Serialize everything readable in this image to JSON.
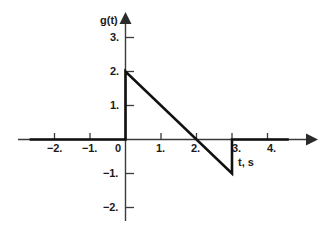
{
  "chart_data": {
    "type": "line",
    "title": "",
    "xlabel": "t, s",
    "ylabel": "g(t)",
    "xlim": [
      -2.7,
      4.7
    ],
    "ylim": [
      -2.5,
      3.4
    ],
    "grid": false,
    "legend": null,
    "xticks": [
      -2,
      -1,
      0,
      1,
      2,
      3,
      4
    ],
    "xtick_labels": [
      "−2.",
      "−1.",
      "0",
      "1.",
      "2.",
      "3.",
      "4."
    ],
    "yticks": [
      -2,
      -1,
      1,
      2,
      3
    ],
    "ytick_labels": [
      "−2.",
      "−1.",
      "1.",
      "2.",
      "3."
    ],
    "series": [
      {
        "name": "g(t)",
        "points": [
          [
            -2.7,
            0
          ],
          [
            0,
            0
          ],
          [
            0,
            2
          ],
          [
            3,
            -1
          ],
          [
            3,
            0
          ],
          [
            4.6,
            0
          ]
        ]
      }
    ],
    "line_color": "#111111",
    "axis_color": "#333333"
  },
  "axes": {
    "y_axis_label": "g(t)",
    "x_axis_label": "t, s"
  }
}
